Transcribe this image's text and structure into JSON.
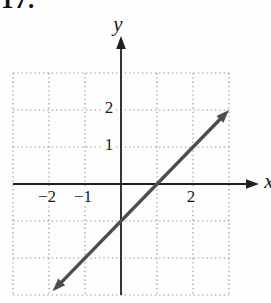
{
  "problem_number": "17.",
  "chart_data": {
    "type": "line",
    "title": "",
    "xlabel": "x",
    "ylabel": "y",
    "xlim": [
      -3,
      3
    ],
    "ylim": [
      -3,
      3
    ],
    "grid": true,
    "grid_style": "dotted",
    "axes_arrows": [
      "x-positive",
      "y-positive"
    ],
    "x_ticks": [
      {
        "value": -2,
        "label": "−2"
      },
      {
        "value": -1,
        "label": "−1"
      },
      {
        "value": 2,
        "label": "2"
      }
    ],
    "y_ticks": [
      {
        "value": 2,
        "label": "2"
      },
      {
        "value": 1,
        "label": "1"
      }
    ],
    "series": [
      {
        "name": "graphed-line",
        "equation": "y = x − 1",
        "slope": 1,
        "y_intercept": -1,
        "x_intercept": 1,
        "endpoints": [
          [
            -1.9,
            -2.9
          ],
          [
            3.0,
            2.0
          ]
        ],
        "arrowheads": "both",
        "color": "#4d4d4d"
      }
    ],
    "colors": {
      "axis": "#1f1f1f",
      "grid": "#8f8f8f",
      "text": "#1a1a1a",
      "background": "#fdfdfd"
    }
  }
}
